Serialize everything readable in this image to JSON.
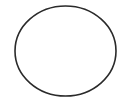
{
  "diagram": {
    "shape": "ellipse",
    "center": [
      65.5,
      51
    ],
    "rx": 50.5,
    "ry": 45,
    "stroke_color": "#2a2a2a",
    "stroke_width": 1.6,
    "fill": "none",
    "background": "#ffffff"
  }
}
